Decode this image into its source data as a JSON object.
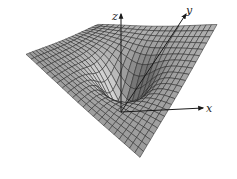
{
  "figure": {
    "type": "3d-surface-plot",
    "axes": {
      "x": {
        "label": "x"
      },
      "y": {
        "label": "y"
      },
      "z": {
        "label": "z"
      }
    },
    "colors": {
      "surface_light": "#d2d2d2",
      "surface_dark": "#6e6e6e",
      "mesh_line": "#1e1e1e",
      "axis": "#1a1a1a",
      "background": "#ffffff"
    },
    "mesh": {
      "rows": 22,
      "cols": 22
    },
    "geometry": {
      "origin": [
        121,
        112
      ],
      "z_axis_top": [
        121,
        14
      ],
      "y_axis_end": [
        186,
        14
      ],
      "x_axis_end": [
        203,
        108
      ],
      "surface_corners": {
        "left": [
          26,
          64
        ],
        "back": [
          98,
          34
        ],
        "right": [
          217,
          34
        ],
        "front": [
          140,
          167
        ]
      }
    }
  }
}
